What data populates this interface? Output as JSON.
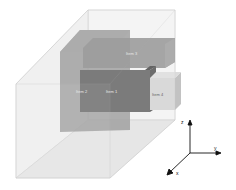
{
  "diagram": {
    "type": "3d-box-packing",
    "container": {
      "name": "container-box"
    },
    "items": [
      {
        "label": "Item 1",
        "color": "#595959"
      },
      {
        "label": "Item 2",
        "color": "#7a7a7a"
      },
      {
        "label": "Item 3",
        "color": "#8a8a8a"
      },
      {
        "label": "Item 4",
        "color": "#cfcfcf"
      }
    ],
    "axes": {
      "z": "z",
      "y": "y",
      "x": "x"
    }
  }
}
